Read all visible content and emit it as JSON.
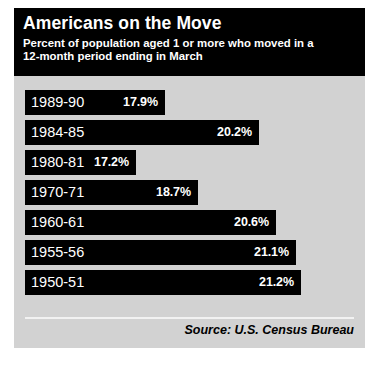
{
  "header": {
    "title": "Americans on the Move",
    "subtitle_line1": "Percent of population aged 1 or more who moved in a",
    "subtitle_line2": "12-month period ending in March"
  },
  "footer": {
    "source": "Source: U.S. Census Bureau"
  },
  "colors": {
    "card_background": "#d2d2d2",
    "bar": "#000000",
    "header_background": "#000000",
    "text_on_dark": "#ffffff",
    "rule": "#f2f2f2"
  },
  "chart_data": {
    "type": "bar",
    "orientation": "horizontal",
    "title": "Americans on the Move",
    "subtitle": "Percent of population aged 1 or more who moved in a 12-month period ending in March",
    "xlabel": "",
    "ylabel": "",
    "xlim": [
      14.5,
      22.5
    ],
    "grid": false,
    "legend": false,
    "value_suffix": "%",
    "categories": [
      "1989-90",
      "1984-85",
      "1980-81",
      "1970-71",
      "1960-61",
      "1955-56",
      "1950-51"
    ],
    "values": [
      17.9,
      20.2,
      17.2,
      18.7,
      20.6,
      21.1,
      21.2
    ],
    "labels": [
      "17.9%",
      "20.2%",
      "17.2%",
      "18.7%",
      "20.6%",
      "21.1%",
      "21.2%"
    ],
    "source": "Source: U.S. Census Bureau"
  }
}
